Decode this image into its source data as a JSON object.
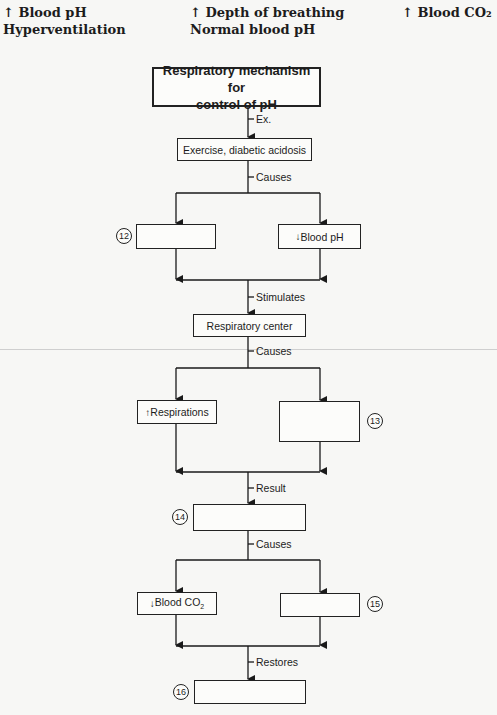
{
  "word_bank": [
    {
      "text": "↑ Blood pH"
    },
    {
      "text": "Hyperventilation"
    },
    {
      "text": "↑ Depth of breathing"
    },
    {
      "text": "Normal blood pH"
    },
    {
      "text": "↑ Blood CO₂"
    }
  ],
  "diagram": {
    "title": "Respiratory mechanism for control of pH",
    "title_line1": "Respiratory mechanism for",
    "title_line2": "control of pH",
    "edges": {
      "ex": "Ex.",
      "causes1": "Causes",
      "stimulates": "Stimulates",
      "causes2": "Causes",
      "result": "Result",
      "causes3": "Causes",
      "restores": "Restores"
    },
    "nodes": {
      "example": "Exercise, diabetic acidosis",
      "blank12": "",
      "blood_ph_arrow": "↓",
      "blood_ph": "Blood pH",
      "respiratory_center": "Respiratory center",
      "respirations_arrow": "↑",
      "respirations": "Respirations",
      "blank13": "",
      "blank14": "",
      "blood_co2_arrow": "↓",
      "blood_co2": "Blood CO",
      "blood_co2_sub": "2",
      "blank15": "",
      "blank16": ""
    },
    "numbers": {
      "n12": "12",
      "n13": "13",
      "n14": "14",
      "n15": "15",
      "n16": "16"
    }
  }
}
